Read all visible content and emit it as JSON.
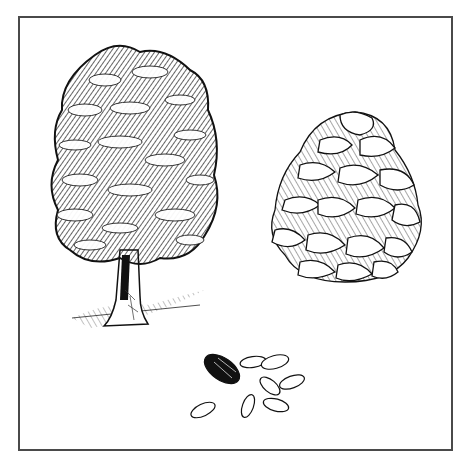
{
  "illustration": {
    "subject": "Pine tree, pine cone and pine nuts",
    "style": "black-and-white pen-and-ink drawing",
    "frame_color": "#4a4a4a",
    "ink_color": "#111111",
    "elements": [
      {
        "name": "tree",
        "description": "Broad leafy pine tree with thick trunk and ground shading"
      },
      {
        "name": "pine-cone",
        "description": "Large open pine cone with layered scales"
      },
      {
        "name": "pine-nuts",
        "description": "One dark shelled seed and eight pale kernels",
        "count": 9
      }
    ]
  }
}
